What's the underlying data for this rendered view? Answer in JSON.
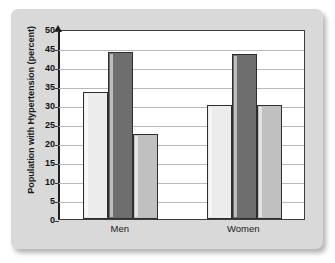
{
  "chart_data": {
    "type": "bar",
    "title": "",
    "xlabel": "",
    "ylabel": "Population with Hypertension (percent)",
    "categories": [
      "Men",
      "Women"
    ],
    "ylim": [
      0,
      50
    ],
    "yticks": [
      0,
      5,
      10,
      15,
      20,
      25,
      30,
      35,
      40,
      45,
      50
    ],
    "ytick_labels": [
      "0",
      "5",
      "10",
      "15",
      "20",
      "25",
      "30",
      "35",
      "40",
      "45",
      "50"
    ],
    "grid": true,
    "legend": false,
    "legend_position": "none",
    "series": [
      {
        "name": "series-1",
        "color": "#ececec",
        "values": [
          33.5,
          30.0
        ]
      },
      {
        "name": "series-2",
        "color": "#6e6e6e",
        "values": [
          44.0,
          43.5
        ]
      },
      {
        "name": "series-3",
        "color": "#c0c0c0",
        "values": [
          22.5,
          30.0
        ]
      }
    ]
  },
  "style": {
    "panel_background": "#d9d9d9",
    "plot_background": "#ffffff",
    "axis_color": "#3d3d3d",
    "grid_color": "#b9b9b9",
    "bar_outline": "#2e2e2e"
  }
}
